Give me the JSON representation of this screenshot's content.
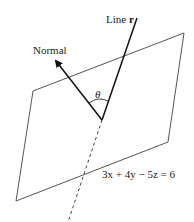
{
  "diagram": {
    "labels": {
      "normal": "Normal",
      "line_prefix": "Line ",
      "line_name": "r",
      "angle": "θ",
      "plane_equation": "3x + 4y − 5z = 6"
    },
    "colors": {
      "plane": "#555555",
      "lines": "#111111"
    }
  }
}
